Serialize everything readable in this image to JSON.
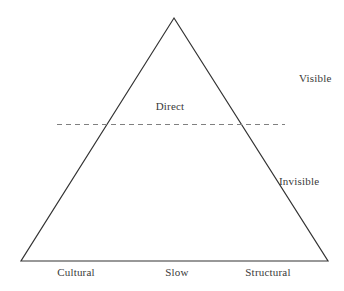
{
  "figure": {
    "type": "triangle-diagram",
    "width": 344,
    "height": 291,
    "background_color": "#ffffff",
    "line_color": "#333333",
    "dashed_line_color": "#808080",
    "text_color": "#3a3a3a"
  },
  "triangle": {
    "apex": {
      "x": 174,
      "y": 18
    },
    "base_left": {
      "x": 21,
      "y": 261
    },
    "base_right": {
      "x": 328,
      "y": 261
    },
    "stroke_width": 1.2
  },
  "divider": {
    "name": "visible-invisible-divider",
    "style": "dashed",
    "y": 124,
    "x_start": 57,
    "x_end": 285,
    "dash_pattern": "5,4"
  },
  "labels": {
    "visible": {
      "text": "Visible",
      "x": 299,
      "y": 72
    },
    "direct": {
      "text": "Direct",
      "x": 170,
      "y": 100
    },
    "invisible": {
      "text": "Invisible",
      "x": 302,
      "y": 175
    },
    "cultural": {
      "text": "Cultural",
      "x": 76,
      "y": 266
    },
    "slow": {
      "text": "Slow",
      "x": 177,
      "y": 266
    },
    "structural": {
      "text": "Structural",
      "x": 268,
      "y": 266
    }
  },
  "chart_data": {
    "type": "diagram",
    "title": "",
    "shape": "triangle",
    "regions": [
      {
        "name": "above-divider",
        "label": "Visible",
        "contains": [
          "Direct"
        ]
      },
      {
        "name": "below-divider",
        "label": "Invisible",
        "contains": [
          "Cultural",
          "Slow",
          "Structural"
        ]
      }
    ],
    "annotations": [
      "Visible",
      "Direct",
      "Invisible",
      "Cultural",
      "Slow",
      "Structural"
    ]
  }
}
